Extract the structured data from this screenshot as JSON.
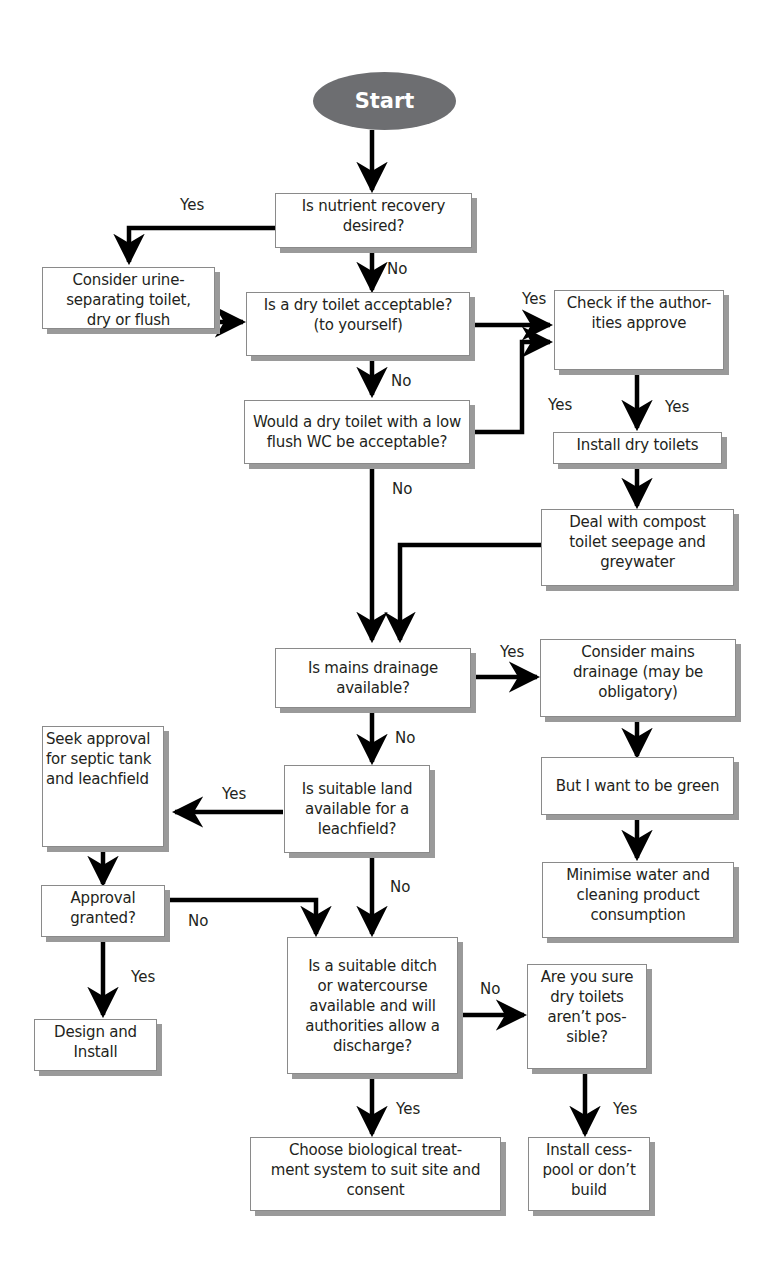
{
  "diagram": {
    "type": "flowchart",
    "start": {
      "label": "Start",
      "fill": "#6d6e71",
      "text_color": "#ffffff"
    },
    "nodes": [
      {
        "id": "nutrient",
        "text": "Is nutrient recovery\ndesired?"
      },
      {
        "id": "urine",
        "text": "Consider urine-\nseparating toilet,\ndry or flush"
      },
      {
        "id": "dry_ok",
        "text": "Is a dry toilet acceptable?\n(to yourself)"
      },
      {
        "id": "authorities",
        "text": "Check if the author-\nities approve"
      },
      {
        "id": "low_flush",
        "text": "Would a dry toilet with a low\nflush WC be acceptable?"
      },
      {
        "id": "install_dry",
        "text": "Install dry toilets"
      },
      {
        "id": "compost",
        "text": "Deal with compost\ntoilet seepage and\ngreywater"
      },
      {
        "id": "mains",
        "text": "Is mains drainage\navailable?"
      },
      {
        "id": "consider_mains",
        "text": "Consider mains\ndrainage (may be\nobligatory)"
      },
      {
        "id": "seek_approval",
        "text": "Seek approval\nfor septic tank\nand leachfield"
      },
      {
        "id": "land",
        "text": "Is suitable land\navailable for a\nleachfield?"
      },
      {
        "id": "green",
        "text": "But I want to be green"
      },
      {
        "id": "approval",
        "text": "Approval\ngranted?"
      },
      {
        "id": "minimise",
        "text": "Minimise water and\ncleaning product\nconsumption"
      },
      {
        "id": "ditch",
        "text": "Is a suitable ditch\nor watercourse\navailable and will\nauthorities allow a\ndischarge?"
      },
      {
        "id": "sure",
        "text": "Are you sure\ndry toilets\naren’t pos-\nsible?"
      },
      {
        "id": "design",
        "text": "Design and\nInstall"
      },
      {
        "id": "biological",
        "text": "Choose biological treat-\nment system to suit site and\nconsent"
      },
      {
        "id": "cesspool",
        "text": "Install cess-\npool or don’t\nbuild"
      }
    ],
    "edge_labels": {
      "nutrient_yes": "Yes",
      "nutrient_no": "No",
      "dry_ok_yes": "Yes",
      "dry_ok_no": "No",
      "low_flush_yes": "Yes",
      "low_flush_no": "No",
      "authorities_yes": "Yes",
      "mains_yes": "Yes",
      "mains_no": "No",
      "land_yes": "Yes",
      "land_no": "No",
      "approval_no": "No",
      "approval_yes": "Yes",
      "ditch_no": "No",
      "ditch_yes": "Yes",
      "sure_yes": "Yes"
    },
    "edges": [
      {
        "from": "start",
        "to": "nutrient"
      },
      {
        "from": "nutrient",
        "to": "urine",
        "label": "Yes"
      },
      {
        "from": "nutrient",
        "to": "dry_ok",
        "label": "No"
      },
      {
        "from": "urine",
        "to": "dry_ok"
      },
      {
        "from": "dry_ok",
        "to": "authorities",
        "label": "Yes"
      },
      {
        "from": "dry_ok",
        "to": "low_flush",
        "label": "No"
      },
      {
        "from": "low_flush",
        "to": "authorities",
        "label": "Yes"
      },
      {
        "from": "low_flush",
        "to": "mains",
        "label": "No"
      },
      {
        "from": "authorities",
        "to": "install_dry",
        "label": "Yes"
      },
      {
        "from": "install_dry",
        "to": "compost"
      },
      {
        "from": "compost",
        "to": "mains"
      },
      {
        "from": "mains",
        "to": "consider_mains",
        "label": "Yes"
      },
      {
        "from": "mains",
        "to": "land",
        "label": "No"
      },
      {
        "from": "consider_mains",
        "to": "green"
      },
      {
        "from": "green",
        "to": "minimise"
      },
      {
        "from": "land",
        "to": "seek_approval",
        "label": "Yes"
      },
      {
        "from": "land",
        "to": "ditch",
        "label": "No"
      },
      {
        "from": "seek_approval",
        "to": "approval"
      },
      {
        "from": "approval",
        "to": "ditch",
        "label": "No"
      },
      {
        "from": "approval",
        "to": "design",
        "label": "Yes"
      },
      {
        "from": "ditch",
        "to": "sure",
        "label": "No"
      },
      {
        "from": "ditch",
        "to": "biological",
        "label": "Yes"
      },
      {
        "from": "sure",
        "to": "cesspool",
        "label": "Yes"
      }
    ]
  }
}
